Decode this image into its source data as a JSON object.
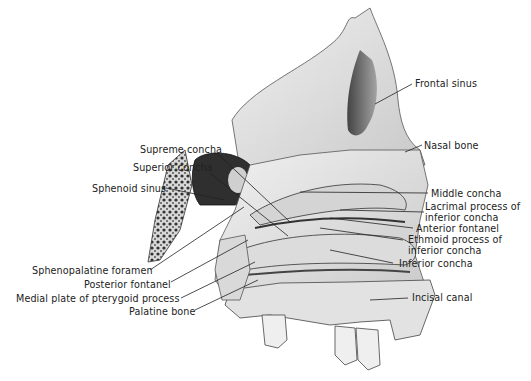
{
  "figure": {
    "labels_left": [
      {
        "id": "supreme-concha",
        "text": "Supreme concha"
      },
      {
        "id": "superior-concha",
        "text": "Superior concha"
      },
      {
        "id": "sphenoid-sinus",
        "text": "Sphenoid sinus"
      },
      {
        "id": "sphenopalatine-foramen",
        "text": "Sphenopalatine foramen"
      },
      {
        "id": "posterior-fontanel",
        "text": "Posterior fontanel"
      },
      {
        "id": "medial-plate-pterygoid",
        "text": "Medial plate of pterygoid process"
      },
      {
        "id": "palatine-bone",
        "text": "Palatine bone"
      }
    ],
    "labels_right": [
      {
        "id": "frontal-sinus",
        "text": "Frontal sinus"
      },
      {
        "id": "nasal-bone",
        "text": "Nasal bone"
      },
      {
        "id": "middle-concha",
        "text": "Middle concha"
      },
      {
        "id": "lacrimal-process",
        "text": "Lacrimal process of",
        "text2": "inferior concha"
      },
      {
        "id": "anterior-fontanel",
        "text": "Anterior fontanel"
      },
      {
        "id": "ethmoid-process",
        "text": "Ethmoid process of",
        "text2": "inferior concha"
      },
      {
        "id": "inferior-concha",
        "text": "Inferior concha"
      },
      {
        "id": "incisal-canal",
        "text": "Incisal canal"
      }
    ]
  },
  "colors": {
    "bone_light": "#e9e9e9",
    "bone_mid": "#bdbdbd",
    "bone_dark": "#3a3a3a",
    "leader_line": "#222222",
    "text": "#222222"
  }
}
